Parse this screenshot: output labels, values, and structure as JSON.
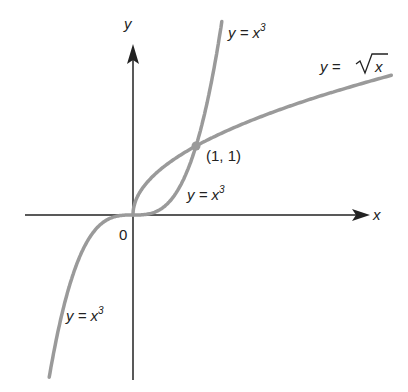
{
  "diagram": {
    "axes": {
      "x_label": "x",
      "y_label": "y",
      "origin_label": "0"
    },
    "curves": [
      {
        "name": "cubic",
        "label": "y = x",
        "exponent": "3",
        "color": "#9a9a9a"
      },
      {
        "name": "sqrt",
        "label_prefix": "y = ",
        "label_var": "x",
        "color": "#9a9a9a"
      }
    ],
    "labels": {
      "cubic_top": {
        "base": "y = x",
        "sup": "3"
      },
      "cubic_mid": {
        "base": "y = x",
        "sup": "3"
      },
      "cubic_bottom": {
        "base": "y = x",
        "sup": "3"
      },
      "sqrt": {
        "prefix": "y = ",
        "radicand": "x"
      }
    },
    "intersection_point": {
      "label": "(1, 1)",
      "x": 1,
      "y": 1,
      "color": "#9a9a9a"
    },
    "colors": {
      "axis": "#222222",
      "curve": "#9a9a9a",
      "text": "#222222"
    }
  }
}
